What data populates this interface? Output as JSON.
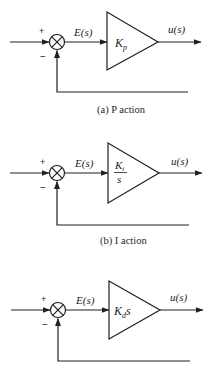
{
  "diagrams": [
    {
      "id": "a",
      "caption": "(a) P action",
      "error_label": "E(s)",
      "output_label": "u(s)",
      "plus_sign": "+",
      "minus_sign": "−",
      "gain": {
        "main": "K",
        "sub": "p",
        "suffix": ""
      },
      "y": 42,
      "feedback_y": 92,
      "caption_y": 112
    },
    {
      "id": "b",
      "caption": "(b) I action",
      "error_label": "E(s)",
      "output_label": "u(s)",
      "plus_sign": "+",
      "minus_sign": "−",
      "gain": {
        "main": "K",
        "sub": "i",
        "denominator": "s"
      },
      "y": 173,
      "feedback_y": 225,
      "caption_y": 244
    },
    {
      "id": "c",
      "caption": "",
      "error_label": "E(s)",
      "output_label": "u(s)",
      "plus_sign": "+",
      "minus_sign": "−",
      "gain": {
        "main": "K",
        "sub": "d",
        "suffix": "s"
      },
      "y": 310,
      "feedback_y": 361,
      "caption_y": null
    }
  ],
  "colors": {
    "stroke": "#231f20",
    "background": "#ffffff"
  }
}
